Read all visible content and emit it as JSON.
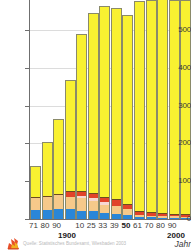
{
  "chart_data": {
    "type": "bar",
    "title": "",
    "subtitle": "",
    "xlabel": "Jahr",
    "ylabel": "",
    "stacked": true,
    "grid": true,
    "legend_position": "none",
    "ylim": [
      0,
      580
    ],
    "yticks": [
      0,
      100,
      200,
      300,
      400,
      500
    ],
    "ytick_labels": [
      "0",
      "100",
      "200",
      "300",
      "400",
      "500"
    ],
    "categories": [
      "71",
      "80",
      "90",
      "00",
      "10",
      "25",
      "33",
      "39",
      "50",
      "61",
      "70",
      "80",
      "90",
      "2000"
    ],
    "xtick_labels": [
      "71",
      "80",
      "90",
      "",
      "10",
      "25",
      "33",
      "39",
      "50",
      "61",
      "70",
      "80",
      "90",
      ""
    ],
    "emphasized_category": "50",
    "decade_marker": "1900",
    "end_marker": "2000",
    "series": [
      {
        "name": "series-blue",
        "color": "#2a86d8",
        "values": [
          23,
          25,
          27,
          26,
          22,
          20,
          17,
          14,
          11,
          6,
          5,
          4,
          4,
          3
        ]
      },
      {
        "name": "series-tan",
        "color": "#f6c98a",
        "values": [
          33,
          33,
          36,
          33,
          33,
          28,
          19,
          21,
          16,
          4,
          4,
          4,
          3,
          3
        ]
      },
      {
        "name": "series-pink",
        "color": "#f7d7d2",
        "values": [
          0,
          0,
          0,
          0,
          7,
          8,
          10,
          0,
          0,
          0,
          0,
          0,
          0,
          0
        ]
      },
      {
        "name": "series-red",
        "color": "#e1432a",
        "values": [
          0,
          0,
          0,
          12,
          9,
          10,
          10,
          17,
          11,
          9,
          7,
          6,
          5,
          5
        ]
      },
      {
        "name": "series-brown",
        "color": "#6b4a20",
        "values": [
          3,
          3,
          3,
          3,
          2,
          2,
          2,
          2,
          2,
          2,
          2,
          2,
          2,
          2
        ]
      },
      {
        "name": "series-yellow",
        "color": "#f9f131",
        "values": [
          82,
          142,
          198,
          293,
          416,
          477,
          506,
          503,
          500,
          555,
          562,
          566,
          566,
          567
        ]
      }
    ],
    "totals": [
      141,
      203,
      264,
      367,
      489,
      545,
      564,
      557,
      540,
      576,
      580,
      582,
      580,
      580
    ],
    "colors": {
      "axis": "#6f6f6f",
      "grid": "#dcdcdc",
      "bar_outline": "#8a8a6a",
      "background": "#ffffff",
      "text": "#3a3a3a"
    }
  },
  "footer": {
    "credit": "Quelle: Statistisches Bundesamt, Wiesbaden 2003",
    "logo_name": "statistik-logo"
  }
}
